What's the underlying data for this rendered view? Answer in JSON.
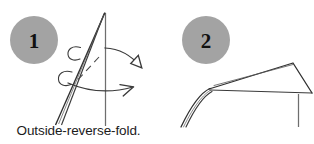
{
  "figure": {
    "type": "origami-instruction-diagram",
    "width": 314,
    "height": 144,
    "background_color": "#ffffff",
    "caption": "Outside-reverse-fold.",
    "line_color": "#3a3a3a",
    "badge_fill_color": "#a3a3a3",
    "badge_text_color": "#111111"
  },
  "steps": [
    {
      "number": "1",
      "badge_label": "1",
      "badge": {
        "cx": 34,
        "cy": 40,
        "r": 24
      },
      "description": "Paper flap with vertical reference line, curved rotation arrows and dashed fold line indicating an outside-reverse-fold.",
      "arrows": [
        {
          "name": "upper-curved-arrow",
          "head": "hollow-triangle"
        },
        {
          "name": "lower-curved-arrow",
          "head": "open-line"
        }
      ],
      "fold_line_style": "dashed"
    },
    {
      "number": "2",
      "badge_label": "2",
      "badge": {
        "cx": 49,
        "cy": 40,
        "r": 24
      },
      "description": "Resulting form after the outside-reverse-fold: triangular flap folded over the vertical stem.",
      "arrows": [],
      "fold_line_style": "solid"
    }
  ]
}
